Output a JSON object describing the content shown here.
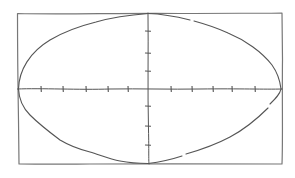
{
  "diagram": {
    "colors": {
      "background": "#ffffff",
      "stroke": "#555555",
      "frame": "#777777"
    },
    "frame": {
      "x": 17,
      "y": 13,
      "width": 265,
      "height": 151
    },
    "center": {
      "x": 148,
      "y": 89
    },
    "ellipse": {
      "cx": 149,
      "cy": 88,
      "rx": 131,
      "ry": 75
    },
    "x_axis": {
      "y": 89,
      "x_start": 17,
      "x_end": 282,
      "ticks": [
        41,
        63,
        86,
        108,
        128,
        171,
        192,
        213,
        232,
        255
      ]
    },
    "y_axis": {
      "x": 148,
      "y_start": 13,
      "y_end": 164,
      "ticks": [
        31,
        53,
        71,
        106,
        126,
        145
      ]
    },
    "labels": []
  }
}
